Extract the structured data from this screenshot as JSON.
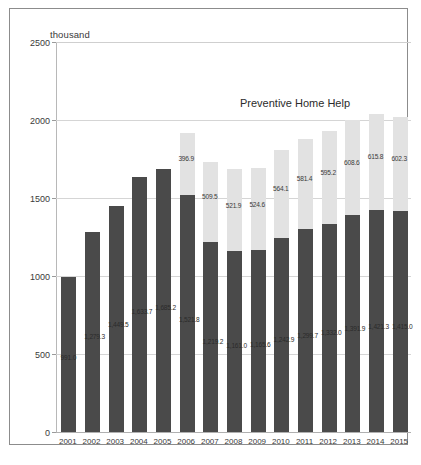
{
  "axis_unit_label": "thousand",
  "series_annotation": "Preventive Home Help",
  "caption": "",
  "colors": {
    "base": "#4a4a4a",
    "preventive": "#e2e2e2",
    "grid": "#d5d5d5",
    "text": "#3a3a3a"
  },
  "chart_data": {
    "type": "bar",
    "title": "",
    "subtitle": "",
    "xlabel": "",
    "ylabel": "thousand",
    "ylim": [
      0,
      2500
    ],
    "yticks": [
      0,
      500,
      1000,
      1500,
      2000,
      2500
    ],
    "grid": true,
    "stacked": true,
    "legend_position": "inside-top-right",
    "annotations": [
      "Preventive Home Help"
    ],
    "categories": [
      "2001",
      "2002",
      "2003",
      "2004",
      "2005",
      "2006",
      "2007",
      "2008",
      "2009",
      "2010",
      "2011",
      "2012",
      "2013",
      "2014",
      "2015"
    ],
    "series": [
      {
        "name": "Home Help",
        "color": "#4a4a4a",
        "values": [
          991.0,
          1279.3,
          1449.5,
          1633.7,
          1685.2,
          1521.8,
          1219.2,
          1161.0,
          1165.6,
          1242.9,
          1299.7,
          1332.0,
          1391.9,
          1421.3,
          1415.0
        ],
        "labels": [
          "991.0",
          "1,279.3",
          "1,449.5",
          "1,633.7",
          "1,685.2",
          "1,521.8",
          "1,219.2",
          "1,161.0",
          "1,165.6",
          "1,242.9",
          "1,299.7",
          "1,332.0",
          "1,391.9",
          "1,421.3",
          "1,415.0"
        ]
      },
      {
        "name": "Preventive Home Help",
        "color": "#e2e2e2",
        "values": [
          0,
          0,
          0,
          0,
          0,
          396.9,
          509.5,
          521.9,
          524.6,
          564.1,
          581.4,
          595.2,
          608.6,
          615.8,
          602.3
        ],
        "labels": [
          "",
          "",
          "",
          "",
          "",
          "396.9",
          "509.5",
          "521.9",
          "524.6",
          "564.1",
          "581.4",
          "595.2",
          "608.6",
          "615.8",
          "602.3"
        ]
      }
    ]
  }
}
